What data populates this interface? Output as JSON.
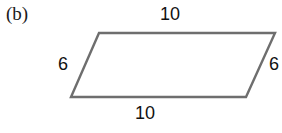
{
  "figure": {
    "panel_label": "(b)",
    "shape": "parallelogram",
    "stroke_color": "#6e6e6e",
    "background_color": "#ffffff",
    "text_color": "#111111",
    "vertices": {
      "top_left": [
        99,
        33
      ],
      "top_right": [
        275,
        33
      ],
      "bottom_right": [
        246,
        97
      ],
      "bottom_left": [
        71,
        97
      ]
    },
    "labels": {
      "top": "10",
      "bottom": "10",
      "left": "6",
      "right": "6"
    }
  }
}
